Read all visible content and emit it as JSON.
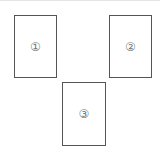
{
  "diagram": {
    "panels": [
      {
        "id": 1,
        "label": "①"
      },
      {
        "id": 2,
        "label": "②"
      },
      {
        "id": 3,
        "label": "③"
      }
    ]
  }
}
